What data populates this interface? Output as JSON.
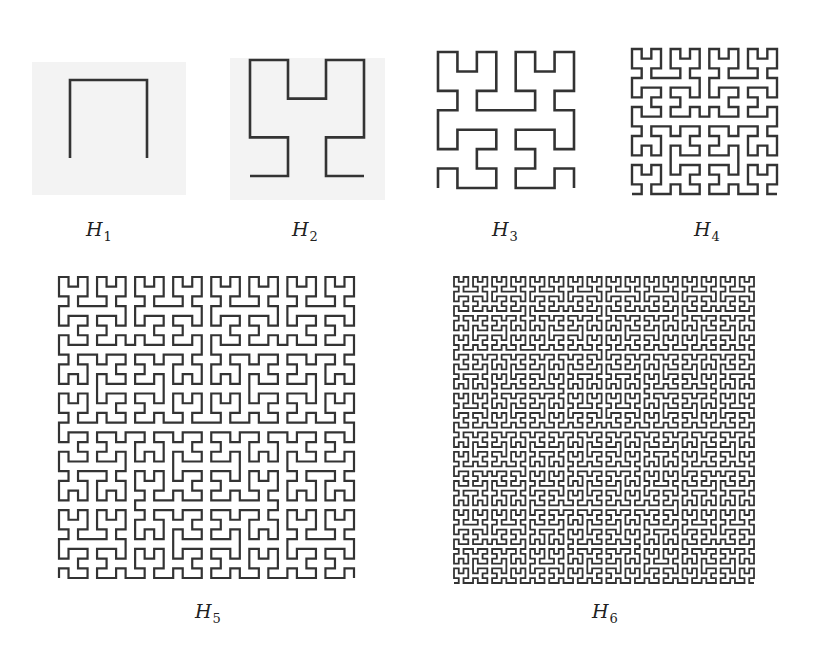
{
  "figure": {
    "stroke_color": "#333333",
    "background_tint": "#f3f3f3",
    "tints": [
      {
        "x": 32,
        "y": 62,
        "w": 154,
        "h": 133
      },
      {
        "x": 230,
        "y": 58,
        "w": 155,
        "h": 142
      }
    ],
    "curves": [
      {
        "id": "H1",
        "order": 1,
        "x0": 70,
        "y0": 80,
        "x1": 147,
        "y1": 158,
        "stroke_width": 2.6
      },
      {
        "id": "H2",
        "order": 2,
        "x0": 250,
        "y0": 60,
        "x1": 364,
        "y1": 176,
        "stroke_width": 2.6
      },
      {
        "id": "H3",
        "order": 3,
        "x0": 438,
        "y0": 52,
        "x1": 574,
        "y1": 188,
        "stroke_width": 2.6
      },
      {
        "id": "H4",
        "order": 4,
        "x0": 632,
        "y0": 49,
        "x1": 777,
        "y1": 194,
        "stroke_width": 2.4
      },
      {
        "id": "H5",
        "order": 5,
        "x0": 59,
        "y0": 277,
        "x1": 354,
        "y1": 578,
        "stroke_width": 2.2
      },
      {
        "id": "H6",
        "order": 6,
        "x0": 454,
        "y0": 277,
        "x1": 754,
        "y1": 583,
        "stroke_width": 1.8
      }
    ],
    "labels": [
      {
        "base": "H",
        "sub": "1",
        "x": 86,
        "y": 220
      },
      {
        "base": "H",
        "sub": "2",
        "x": 292,
        "y": 220
      },
      {
        "base": "H",
        "sub": "3",
        "x": 492,
        "y": 220
      },
      {
        "base": "H",
        "sub": "4",
        "x": 694,
        "y": 220
      },
      {
        "base": "H",
        "sub": "5",
        "x": 195,
        "y": 602
      },
      {
        "base": "H",
        "sub": "6",
        "x": 592,
        "y": 602
      }
    ]
  }
}
